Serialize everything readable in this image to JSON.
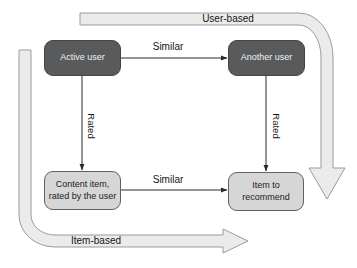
{
  "diagram": {
    "bands": {
      "user_based": {
        "label": "User-based"
      },
      "item_based": {
        "label": "Item-based"
      }
    },
    "nodes": {
      "active_user": {
        "label": "Active user"
      },
      "another_user": {
        "label": "Another user"
      },
      "content_item": {
        "lines": [
          "Content item,",
          "rated by the user"
        ]
      },
      "item_to_recommend": {
        "lines": [
          "Item to",
          "recommend"
        ]
      }
    },
    "edges": {
      "users_similar": {
        "label": "Similar"
      },
      "items_similar": {
        "label": "Similar"
      },
      "active_user_rated": {
        "label": "Rated"
      },
      "another_user_rated": {
        "label": "Rated"
      }
    },
    "colors": {
      "dark_node_fill": "#595a5c",
      "dark_node_border": "#434445",
      "dark_node_text": "#f2f2f2",
      "light_node_fill": "#d6d6d6",
      "light_node_border": "#5f6061",
      "light_node_text": "#1c1c1c",
      "band_fill": "#ebebeb",
      "band_stroke": "#9b9b9b",
      "connector": "#2a2a2a",
      "label_text": "#161616",
      "background": "#ffffff"
    }
  }
}
